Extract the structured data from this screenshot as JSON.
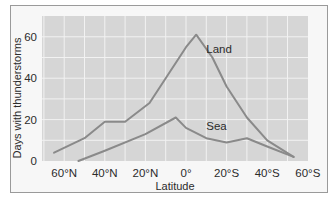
{
  "chart_data": {
    "type": "line",
    "title": "",
    "xlabel": "Latitude",
    "ylabel": "Days with thunderstorms",
    "x_ticks": [
      "60°N",
      "40°N",
      "20°N",
      "0°",
      "20°S",
      "40°S",
      "60°S"
    ],
    "x_tick_values": [
      60,
      40,
      20,
      0,
      -20,
      -40,
      -60
    ],
    "y_ticks": [
      "0",
      "20",
      "40",
      "60"
    ],
    "y_tick_values": [
      0,
      20,
      40,
      60
    ],
    "xlim": [
      65,
      -60
    ],
    "ylim": [
      0,
      65
    ],
    "grid": true,
    "legend": "inline labels",
    "series": [
      {
        "name": "Land",
        "color": "#8a8a8a",
        "label_pos": {
          "lat": -10,
          "days": 52
        },
        "points": [
          {
            "lat": 65,
            "days": 4
          },
          {
            "lat": 50,
            "days": 11
          },
          {
            "lat": 40,
            "days": 19
          },
          {
            "lat": 30,
            "days": 19
          },
          {
            "lat": 18,
            "days": 28
          },
          {
            "lat": 0,
            "days": 55
          },
          {
            "lat": -5,
            "days": 61
          },
          {
            "lat": -13,
            "days": 50
          },
          {
            "lat": -20,
            "days": 36
          },
          {
            "lat": -30,
            "days": 21
          },
          {
            "lat": -40,
            "days": 10
          },
          {
            "lat": -53,
            "days": 2
          }
        ]
      },
      {
        "name": "Sea",
        "color": "#8a8a8a",
        "label_pos": {
          "lat": -10,
          "days": 15
        },
        "points": [
          {
            "lat": 53,
            "days": 0
          },
          {
            "lat": 40,
            "days": 5
          },
          {
            "lat": 20,
            "days": 13
          },
          {
            "lat": 5,
            "days": 21
          },
          {
            "lat": 0,
            "days": 16
          },
          {
            "lat": -10,
            "days": 11
          },
          {
            "lat": -20,
            "days": 9
          },
          {
            "lat": -30,
            "days": 11
          },
          {
            "lat": -40,
            "days": 7
          },
          {
            "lat": -53,
            "days": 2
          }
        ]
      }
    ]
  },
  "colors": {
    "plot_background": "#d6d6d6",
    "grid": "#f2f2f2",
    "line": "#8a8a8a",
    "text": "#2b2b2b"
  }
}
